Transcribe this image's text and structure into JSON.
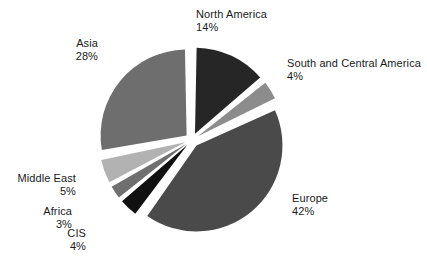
{
  "chart_data": {
    "type": "pie",
    "title": "",
    "subtitle": "",
    "xlabel": "",
    "ylabel": "",
    "legend_position": "none",
    "grid": false,
    "units": "%",
    "total": 100,
    "categories": [
      "North America",
      "South and Central America",
      "Europe",
      "CIS",
      "Africa",
      "Middle East",
      "Asia"
    ],
    "values": [
      14,
      4,
      42,
      4,
      3,
      5,
      28
    ],
    "slices": [
      {
        "label": "North America",
        "value": 14,
        "value_text": "14%",
        "color": "#262626",
        "start_angle": 0,
        "end_angle": 50.4,
        "exploded": true
      },
      {
        "label": "South and Central America",
        "value": 4,
        "value_text": "4%",
        "color": "#8c8c8c",
        "start_angle": 50.4,
        "end_angle": 64.8,
        "exploded": true
      },
      {
        "label": "Europe",
        "value": 42,
        "value_text": "42%",
        "color": "#4a4a4a",
        "start_angle": 64.8,
        "end_angle": 216.0,
        "exploded": true
      },
      {
        "label": "CIS",
        "value": 4,
        "value_text": "4%",
        "color": "#111111",
        "start_angle": 216.0,
        "end_angle": 230.4,
        "exploded": true
      },
      {
        "label": "Africa",
        "value": 3,
        "value_text": "3%",
        "color": "#6f6f6f",
        "start_angle": 230.4,
        "end_angle": 241.2,
        "exploded": true
      },
      {
        "label": "Middle East",
        "value": 5,
        "value_text": "5%",
        "color": "#b2b2b2",
        "start_angle": 241.2,
        "end_angle": 259.2,
        "exploded": true
      },
      {
        "label": "Asia",
        "value": 28,
        "value_text": "28%",
        "color": "#6e6e6e",
        "start_angle": 259.2,
        "end_angle": 360.0,
        "exploded": true
      }
    ]
  },
  "labels": {
    "north_america": {
      "name": "North America",
      "value": "14%"
    },
    "south_central": {
      "name": "South and Central America",
      "value": "4%"
    },
    "europe": {
      "name": "Europe",
      "value": "42%"
    },
    "cis": {
      "name": "CIS",
      "value": "4%"
    },
    "africa": {
      "name": "Africa",
      "value": "3%"
    },
    "middle_east": {
      "name": "Middle East",
      "value": "5%"
    },
    "asia": {
      "name": "Asia",
      "value": "28%"
    }
  },
  "colors": {
    "background": "#ffffff",
    "text": "#1a1a1a",
    "north_america": "#262626",
    "south_central": "#8c8c8c",
    "europe": "#4a4a4a",
    "cis": "#111111",
    "africa": "#6f6f6f",
    "middle_east": "#b2b2b2",
    "asia": "#6e6e6e"
  }
}
